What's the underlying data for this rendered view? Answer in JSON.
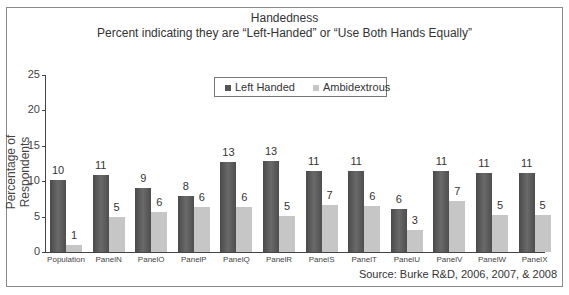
{
  "chart_data": {
    "type": "bar",
    "title": "Handedness",
    "subtitle": "Percent indicating they are “Left-Handed” or “Use Both Hands Equally”",
    "xlabel": "",
    "ylabel": "Percentage of Respondents",
    "ylim": [
      0,
      25
    ],
    "yticks": [
      0,
      5,
      10,
      15,
      20,
      25
    ],
    "grid": false,
    "legend_position": "top-center",
    "categories": [
      "Population",
      "PanelN",
      "PanelO",
      "PanelP",
      "PanelQ",
      "PanelR",
      "PanelS",
      "PanelT",
      "PanelU",
      "PanelV",
      "PanelW",
      "PanelX"
    ],
    "series": [
      {
        "name": "Left Handed",
        "color": "#555555",
        "values": [
          10,
          11,
          9,
          8,
          13,
          13,
          11,
          11,
          6,
          11,
          11,
          11
        ],
        "plotted": [
          10.1,
          10.9,
          9.1,
          7.9,
          12.7,
          12.9,
          11.5,
          11.4,
          6.1,
          11.4,
          11.2,
          11.2
        ]
      },
      {
        "name": "Ambidextrous",
        "color": "#c6c6c6",
        "values": [
          1,
          5,
          6,
          6,
          6,
          5,
          7,
          6,
          3,
          7,
          5,
          5
        ],
        "plotted": [
          1.0,
          4.9,
          5.7,
          6.3,
          6.4,
          5.1,
          6.6,
          6.5,
          3.1,
          7.2,
          5.2,
          5.2
        ]
      }
    ],
    "annotation": "Source: Burke R&D, 2006, 2007, & 2008"
  }
}
